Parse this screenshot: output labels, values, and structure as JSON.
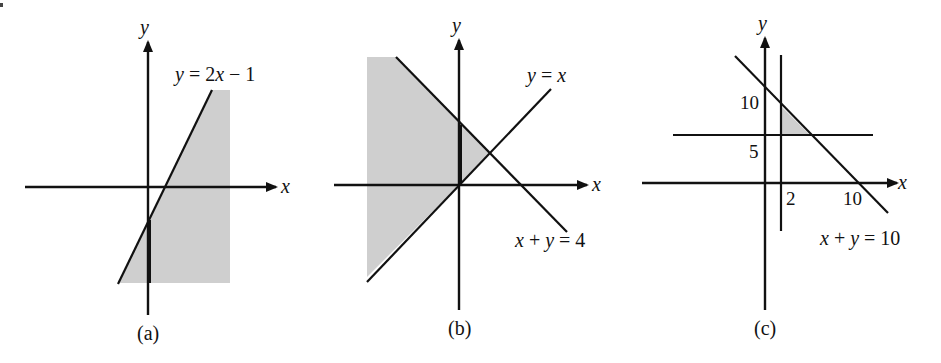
{
  "figure": {
    "colors": {
      "ink": "#111111",
      "shading": "#cfcfcf",
      "background": "#ffffff"
    },
    "panels": [
      {
        "id": "a",
        "caption": "(a)",
        "axis_labels": {
          "x": "x",
          "y": "y"
        },
        "lines": [
          {
            "label_parts": [
              "y",
              " = 2",
              "x",
              " − 1"
            ],
            "equation": "y = 2x − 1"
          }
        ],
        "tick_labels": [],
        "shaded_region": "y ≤ 2x − 1 (region to the right of / below the line)"
      },
      {
        "id": "b",
        "caption": "(b)",
        "axis_labels": {
          "x": "x",
          "y": "y"
        },
        "lines": [
          {
            "label_parts": [
              "y",
              " = ",
              "x"
            ],
            "equation": "y = x"
          },
          {
            "label_parts": [
              "x",
              " + ",
              "y",
              " = 4"
            ],
            "equation": "x + y = 4"
          }
        ],
        "tick_labels": [],
        "shaded_region": "y ≥ x and x + y ≤ 4"
      },
      {
        "id": "c",
        "caption": "(c)",
        "axis_labels": {
          "x": "x",
          "y": "y"
        },
        "lines": [
          {
            "label_parts": [
              "x",
              " + ",
              "y",
              " = 10"
            ],
            "equation": "x + y = 10"
          },
          {
            "equation": "x = 2"
          },
          {
            "equation": "y = 5"
          }
        ],
        "tick_labels": {
          "y_10": "10",
          "y_5": "5",
          "x_2": "2",
          "x_10": "10"
        },
        "shaded_region": "x ≥ 2, y ≥ 5, x + y ≤ 10"
      }
    ]
  }
}
